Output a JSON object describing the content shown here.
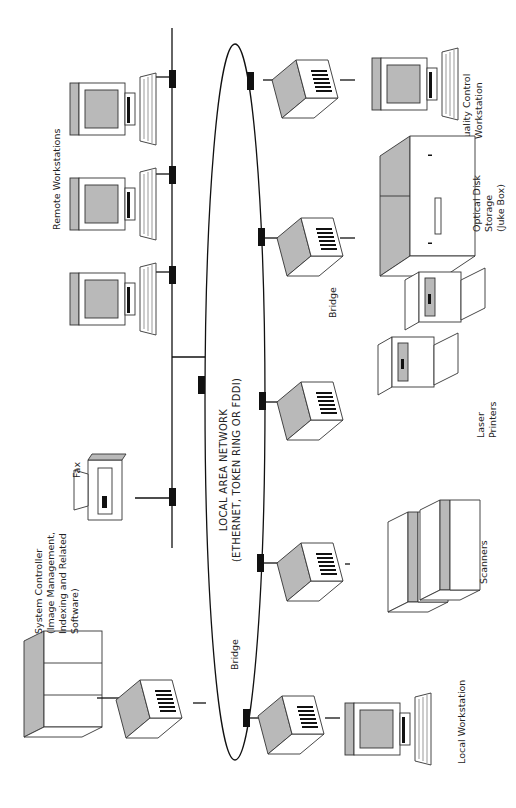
{
  "diagram": {
    "rotation_deg": -90,
    "network": {
      "line1": "LOCAL AREA NETWORK",
      "line2": "(ETHERNET,  TOKEN RING OR FDDI)"
    },
    "labels": {
      "remote_workstations": "Remote Workstations",
      "fax": "Fax",
      "system_controller": [
        "System Controller",
        "(Image Management,",
        "Indexing and Related",
        "Software)"
      ],
      "bridge_controller": "Bridge",
      "bridge_printers": "Bridge",
      "local_workstation": "Local Workstation",
      "scanners": "Scanners",
      "laser_printers": [
        "Laser",
        "Printers"
      ],
      "optical_disk": [
        "Optical Disk",
        "Storage",
        "(Juke Box)"
      ],
      "quality_control": [
        "Quality Control",
        "Workstation"
      ]
    },
    "nodes": [
      {
        "id": "remote-workstation-1",
        "type": "workstation"
      },
      {
        "id": "remote-workstation-2",
        "type": "workstation"
      },
      {
        "id": "remote-workstation-3",
        "type": "workstation"
      },
      {
        "id": "fax",
        "type": "fax"
      },
      {
        "id": "system-controller",
        "type": "server"
      },
      {
        "id": "bridge-controller",
        "type": "bridge"
      },
      {
        "id": "local-workstation",
        "type": "workstation"
      },
      {
        "id": "scanners",
        "type": "scanner"
      },
      {
        "id": "laser-printers",
        "type": "printer"
      },
      {
        "id": "optical-disk-storage",
        "type": "jukebox"
      },
      {
        "id": "quality-control-workstation",
        "type": "workstation"
      }
    ],
    "colors": {
      "line": "#111111",
      "shade": "#b9b9b9",
      "background": "#ffffff"
    }
  }
}
